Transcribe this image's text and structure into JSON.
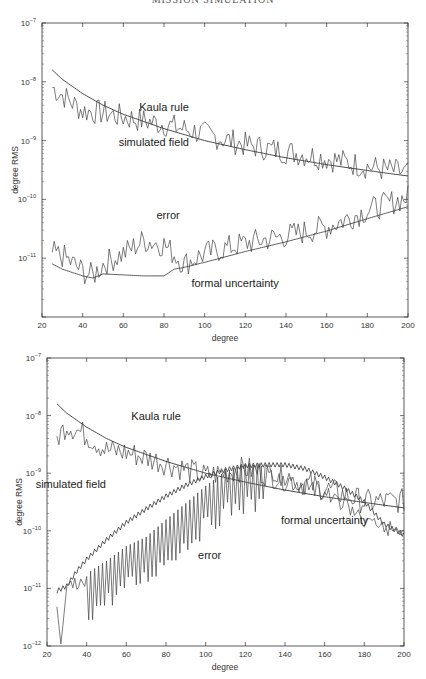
{
  "page": {
    "heading": "MISSION SIMULATION"
  },
  "chart_data": [
    {
      "type": "line",
      "title": "",
      "xlabel": "degree",
      "ylabel": "degree RMS",
      "xlim": [
        20,
        200
      ],
      "ylim": [
        1e-12,
        1e-07
      ],
      "yscale": "log",
      "xticks": [
        20,
        40,
        60,
        80,
        100,
        120,
        140,
        160,
        180,
        200
      ],
      "yticks_labels": [
        "10^-7",
        "10^-8",
        "10^-9",
        "10^-10",
        "10^-11"
      ],
      "grid": false,
      "annotations": [
        {
          "text": "Kaula rule",
          "x": 80,
          "y": 3.2e-09
        },
        {
          "text": "simulated field",
          "x": 75,
          "y": 8e-10
        },
        {
          "text": "error",
          "x": 82,
          "y": 4.6e-11
        },
        {
          "text": "formal uncertainty",
          "x": 115,
          "y": 3.2e-12
        }
      ],
      "series": [
        {
          "name": "Kaula rule",
          "x": [
            25,
            30,
            40,
            50,
            60,
            80,
            100,
            120,
            140,
            160,
            180,
            200
          ],
          "y": [
            1.6e-08,
            1.1e-08,
            6.3e-09,
            4e-09,
            2.8e-09,
            1.6e-09,
            1e-09,
            7e-10,
            5.1e-10,
            3.9e-10,
            3.1e-10,
            2.5e-10
          ]
        },
        {
          "name": "simulated field",
          "x": [
            25,
            30,
            40,
            50,
            60,
            80,
            100,
            120,
            140,
            160,
            180,
            200
          ],
          "y": [
            8e-09,
            6e-09,
            3.2e-09,
            3e-09,
            2.5e-09,
            1.9e-09,
            1.3e-09,
            8.5e-10,
            6.5e-10,
            5e-10,
            3.6e-10,
            2.8e-10
          ]
        },
        {
          "name": "error",
          "x": [
            25,
            30,
            40,
            45,
            50,
            60,
            70,
            80,
            90,
            100,
            120,
            140,
            160,
            180,
            200
          ],
          "y": [
            1.2e-11,
            1.1e-11,
            6e-12,
            5e-12,
            8e-12,
            1.2e-11,
            2e-11,
            1.7e-11,
            8e-12,
            1.2e-11,
            1.8e-11,
            2.4e-11,
            3.4e-11,
            6.5e-11,
            1.1e-10
          ]
        },
        {
          "name": "formal uncertainty",
          "x": [
            25,
            30,
            40,
            45,
            50,
            60,
            70,
            80,
            85,
            90,
            100,
            120,
            140,
            160,
            180,
            200
          ],
          "y": [
            8e-12,
            6.5e-12,
            5e-12,
            4.6e-12,
            5.4e-12,
            5.2e-12,
            5e-12,
            5e-12,
            6.5e-12,
            7e-12,
            8.5e-12,
            1.3e-11,
            1.9e-11,
            2.9e-11,
            4.7e-11,
            7.5e-11
          ]
        }
      ]
    },
    {
      "type": "line",
      "title": "",
      "xlabel": "degree",
      "ylabel": "degree RMS",
      "xlim": [
        20,
        200
      ],
      "ylim": [
        1e-12,
        1e-07
      ],
      "yscale": "log",
      "xticks": [
        20,
        40,
        60,
        80,
        100,
        120,
        140,
        160,
        180,
        200
      ],
      "yticks_labels": [
        "10^-7",
        "10^-8",
        "10^-9",
        "10^-10",
        "10^-11",
        "10^-12"
      ],
      "grid": false,
      "annotations": [
        {
          "text": "Kaula rule",
          "x": 75,
          "y": 8.5e-09
        },
        {
          "text": "simulated field",
          "x": 32,
          "y": 5.5e-10
        },
        {
          "text": "formal uncertainty",
          "x": 160,
          "y": 1.3e-10
        },
        {
          "text": "error",
          "x": 102,
          "y": 3.2e-11
        }
      ],
      "series": [
        {
          "name": "Kaula rule",
          "x": [
            25,
            30,
            40,
            50,
            60,
            80,
            100,
            120,
            140,
            160,
            180,
            200
          ],
          "y": [
            1.6e-08,
            1.1e-08,
            6.3e-09,
            4e-09,
            2.8e-09,
            1.6e-09,
            1e-09,
            7e-10,
            5.1e-10,
            3.9e-10,
            3.1e-10,
            2.5e-10
          ]
        },
        {
          "name": "simulated field",
          "x": [
            25,
            30,
            40,
            50,
            60,
            80,
            100,
            120,
            140,
            160,
            180,
            200
          ],
          "y": [
            4e-09,
            7e-09,
            4.5e-09,
            2.5e-09,
            2.3e-09,
            1.5e-09,
            9e-10,
            1.2e-09,
            8e-10,
            5.5e-10,
            3.2e-10,
            3.3e-10
          ]
        },
        {
          "name": "formal uncertainty",
          "x": [
            25,
            30,
            35,
            40,
            50,
            60,
            70,
            80,
            90,
            100,
            110,
            120,
            130,
            140,
            150,
            160,
            170,
            180,
            190,
            200
          ],
          "y": [
            9e-12,
            1.1e-11,
            2e-11,
            3.2e-11,
            7e-11,
            1.4e-10,
            2.4e-10,
            4e-10,
            6.2e-10,
            8.8e-10,
            1.15e-09,
            1.35e-09,
            1.4e-09,
            1.4e-09,
            1.2e-09,
            8.5e-10,
            5.5e-10,
            3.2e-10,
            1.3e-10,
            8.5e-11
          ]
        },
        {
          "name": "error",
          "x": [
            25,
            27,
            30,
            35,
            40,
            50,
            60,
            70,
            80,
            90,
            100,
            110,
            120,
            130,
            140,
            150,
            160,
            170,
            180,
            190,
            200
          ],
          "y": [
            5e-12,
            1.2e-12,
            1.4e-11,
            1.3e-11,
            1.5e-11,
            2.5e-11,
            4.5e-11,
            6.5e-11,
            1.3e-10,
            2.5e-10,
            5e-10,
            9e-10,
            1.2e-09,
            1.1e-09,
            8e-10,
            6e-10,
            4.5e-10,
            2.8e-10,
            1.5e-10,
            1.1e-10,
            1.05e-10
          ]
        }
      ]
    }
  ]
}
